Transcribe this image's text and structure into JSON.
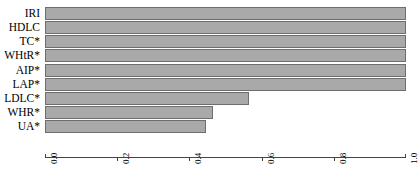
{
  "chart_data": {
    "type": "bar",
    "orientation": "horizontal",
    "title": "",
    "xlabel": "",
    "ylabel": "",
    "xlim": [
      0.0,
      1.0
    ],
    "grid": false,
    "legend": null,
    "bar_color": "#a9a9a9",
    "bar_border_color": "#6e6e6e",
    "axis_color": "#444444",
    "xticks": [
      "0.0",
      "0.2",
      "0.4",
      "0.6",
      "0.8",
      "1.0"
    ],
    "xtick_values": [
      0.0,
      0.2,
      0.4,
      0.6,
      0.8,
      1.0
    ],
    "categories": [
      "IRI",
      "HDLC",
      "TC*",
      "WHtR*",
      "AIP*",
      "LAP*",
      "LDLC*",
      "WHR*",
      "UA*"
    ],
    "values": [
      1.0,
      1.0,
      1.0,
      1.0,
      1.0,
      1.0,
      0.565,
      0.465,
      0.445
    ]
  }
}
